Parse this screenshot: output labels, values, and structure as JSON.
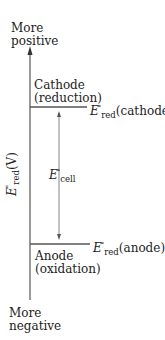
{
  "diagram": {
    "axis": {
      "top_label_line1": "More",
      "top_label_line2": "positive",
      "bottom_label_line1": "More",
      "bottom_label_line2": "negative",
      "label_symbol": "E",
      "label_superscript": "°",
      "label_subscript": "red",
      "label_unit": "(V)"
    },
    "cathode": {
      "name": "Cathode",
      "process": "(reduction)",
      "potential_symbol": "E",
      "potential_superscript": "°",
      "potential_subscript": "red",
      "potential_label": "(cathode)"
    },
    "anode": {
      "name": "Anode",
      "process": "(oxidation)",
      "potential_symbol": "E",
      "potential_superscript": "°",
      "potential_subscript": "red",
      "potential_label": "(anode)"
    },
    "cell": {
      "symbol": "E",
      "superscript": "°",
      "subscript": "cell"
    },
    "colors": {
      "line": "#555555",
      "text": "#222222"
    }
  }
}
